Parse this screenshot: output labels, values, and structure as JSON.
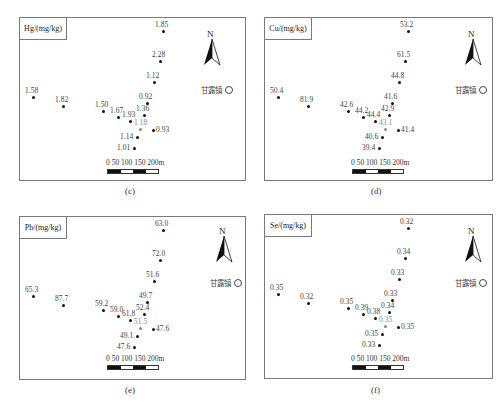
{
  "figure": {
    "town_label": "甘露镇",
    "scale_label": "0  50 100 150 200m",
    "north_label": "N",
    "panels": [
      {
        "id": "c",
        "caption": "(c)",
        "legend": "Hg/(mg/kg)",
        "points": [
          {
            "value": "1.85",
            "x": 143,
            "y": 13
          },
          {
            "value": "2.28",
            "x": 140,
            "y": 43
          },
          {
            "value": "1.12",
            "x": 134,
            "y": 64
          },
          {
            "value": "1.58",
            "x": 13,
            "y": 79
          },
          {
            "value": "1.82",
            "x": 43,
            "y": 88
          },
          {
            "value": "1.50",
            "x": 83,
            "y": 93
          },
          {
            "value": "0.92",
            "x": 127,
            "y": 85
          },
          {
            "value": "1.67",
            "x": 98,
            "y": 99
          },
          {
            "value": "1.36",
            "x": 124,
            "y": 97
          },
          {
            "value": "1.93",
            "x": 110,
            "y": 103
          },
          {
            "value": "1.18",
            "x": 120,
            "y": 111,
            "faint": true
          },
          {
            "value": "0.93",
            "x": 133,
            "y": 112
          },
          {
            "value": "1.14",
            "x": 117,
            "y": 119
          },
          {
            "value": "1.01",
            "x": 114,
            "y": 130
          }
        ]
      },
      {
        "id": "d",
        "caption": "(d)",
        "legend": "Cu/(mg/kg)",
        "points": [
          {
            "value": "53.2",
            "x": 143,
            "y": 13
          },
          {
            "value": "61.5",
            "x": 140,
            "y": 43
          },
          {
            "value": "44.8",
            "x": 134,
            "y": 64
          },
          {
            "value": "50.4",
            "x": 13,
            "y": 79
          },
          {
            "value": "81.9",
            "x": 43,
            "y": 88
          },
          {
            "value": "42.6",
            "x": 83,
            "y": 93
          },
          {
            "value": "41.6",
            "x": 127,
            "y": 85
          },
          {
            "value": "44.2",
            "x": 98,
            "y": 99
          },
          {
            "value": "42.9",
            "x": 124,
            "y": 97
          },
          {
            "value": "44.4",
            "x": 110,
            "y": 103
          },
          {
            "value": "43.1",
            "x": 120,
            "y": 111,
            "faint": true
          },
          {
            "value": "41.4",
            "x": 133,
            "y": 112
          },
          {
            "value": "40.6",
            "x": 117,
            "y": 119
          },
          {
            "value": "39.4",
            "x": 114,
            "y": 130
          }
        ]
      },
      {
        "id": "e",
        "caption": "(e)",
        "legend": "Pb/(mg/kg)",
        "points": [
          {
            "value": "63.0",
            "x": 143,
            "y": 13
          },
          {
            "value": "72.0",
            "x": 140,
            "y": 43
          },
          {
            "value": "51.6",
            "x": 134,
            "y": 64
          },
          {
            "value": "65.3",
            "x": 13,
            "y": 79
          },
          {
            "value": "87.7",
            "x": 43,
            "y": 88
          },
          {
            "value": "59.2",
            "x": 83,
            "y": 93
          },
          {
            "value": "49.7",
            "x": 127,
            "y": 85
          },
          {
            "value": "59.0",
            "x": 98,
            "y": 99
          },
          {
            "value": "52.4",
            "x": 124,
            "y": 97
          },
          {
            "value": "61.8",
            "x": 110,
            "y": 103
          },
          {
            "value": "51.5",
            "x": 120,
            "y": 111,
            "faint": true
          },
          {
            "value": "47.6",
            "x": 133,
            "y": 112
          },
          {
            "value": "49.1",
            "x": 117,
            "y": 119
          },
          {
            "value": "47.6",
            "x": 114,
            "y": 130
          }
        ]
      },
      {
        "id": "f",
        "caption": "(f)",
        "legend": "Se/(mg/kg)",
        "points": [
          {
            "value": "0.32",
            "x": 143,
            "y": 13
          },
          {
            "value": "0.34",
            "x": 140,
            "y": 43
          },
          {
            "value": "0.33",
            "x": 134,
            "y": 64
          },
          {
            "value": "0.35",
            "x": 13,
            "y": 79
          },
          {
            "value": "0.32",
            "x": 43,
            "y": 88
          },
          {
            "value": "0.35",
            "x": 83,
            "y": 93
          },
          {
            "value": "0.33",
            "x": 127,
            "y": 85
          },
          {
            "value": "0.39",
            "x": 98,
            "y": 99
          },
          {
            "value": "0.34",
            "x": 124,
            "y": 97
          },
          {
            "value": "0.38",
            "x": 110,
            "y": 103
          },
          {
            "value": "0.35",
            "x": 120,
            "y": 111,
            "faint": true
          },
          {
            "value": "0.35",
            "x": 133,
            "y": 112
          },
          {
            "value": "0.35",
            "x": 117,
            "y": 119
          },
          {
            "value": "0.33",
            "x": 114,
            "y": 130
          }
        ]
      }
    ]
  }
}
